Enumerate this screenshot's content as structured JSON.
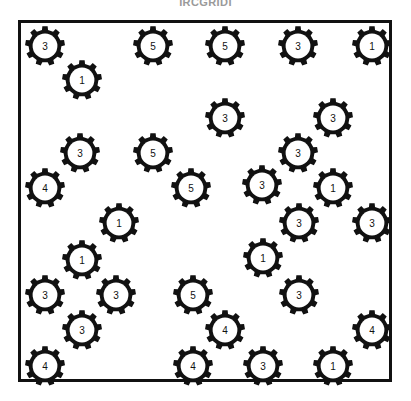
{
  "page": {
    "title": "IRCGRIDI",
    "background_color": "#ffffff"
  },
  "board": {
    "border_color": "#111111",
    "fill_color": "#ffffff",
    "x": 18,
    "y": 20,
    "width": 374,
    "height": 362
  },
  "gear_style": {
    "body_color": "#111111",
    "hole_color": "#ffffff",
    "label_color": "#111111",
    "teeth": 9,
    "diameter": 40
  },
  "gears": [
    {
      "label": "3",
      "x": 42,
      "y": 43
    },
    {
      "label": "5",
      "x": 150,
      "y": 43
    },
    {
      "label": "5",
      "x": 222,
      "y": 43
    },
    {
      "label": "3",
      "x": 295,
      "y": 43
    },
    {
      "label": "1",
      "x": 369,
      "y": 43
    },
    {
      "label": "1",
      "x": 79,
      "y": 77
    },
    {
      "label": "3",
      "x": 222,
      "y": 115
    },
    {
      "label": "3",
      "x": 330,
      "y": 115
    },
    {
      "label": "3",
      "x": 77,
      "y": 150
    },
    {
      "label": "5",
      "x": 150,
      "y": 150
    },
    {
      "label": "3",
      "x": 295,
      "y": 150
    },
    {
      "label": "4",
      "x": 42,
      "y": 185
    },
    {
      "label": "5",
      "x": 188,
      "y": 185
    },
    {
      "label": "3",
      "x": 259,
      "y": 182
    },
    {
      "label": "1",
      "x": 330,
      "y": 185
    },
    {
      "label": "1",
      "x": 116,
      "y": 220
    },
    {
      "label": "3",
      "x": 296,
      "y": 220
    },
    {
      "label": "3",
      "x": 369,
      "y": 220
    },
    {
      "label": "1",
      "x": 260,
      "y": 255
    },
    {
      "label": "1",
      "x": 79,
      "y": 257
    },
    {
      "label": "3",
      "x": 42,
      "y": 292
    },
    {
      "label": "3",
      "x": 113,
      "y": 292
    },
    {
      "label": "5",
      "x": 190,
      "y": 292
    },
    {
      "label": "3",
      "x": 296,
      "y": 292
    },
    {
      "label": "3",
      "x": 79,
      "y": 327
    },
    {
      "label": "4",
      "x": 222,
      "y": 327
    },
    {
      "label": "4",
      "x": 369,
      "y": 327
    },
    {
      "label": "4",
      "x": 42,
      "y": 363
    },
    {
      "label": "4",
      "x": 190,
      "y": 363
    },
    {
      "label": "3",
      "x": 260,
      "y": 363
    },
    {
      "label": "1",
      "x": 330,
      "y": 363
    }
  ],
  "counts": {
    "total": 31,
    "ones": 7,
    "threes": 13,
    "fours": 5,
    "fives": 6
  }
}
